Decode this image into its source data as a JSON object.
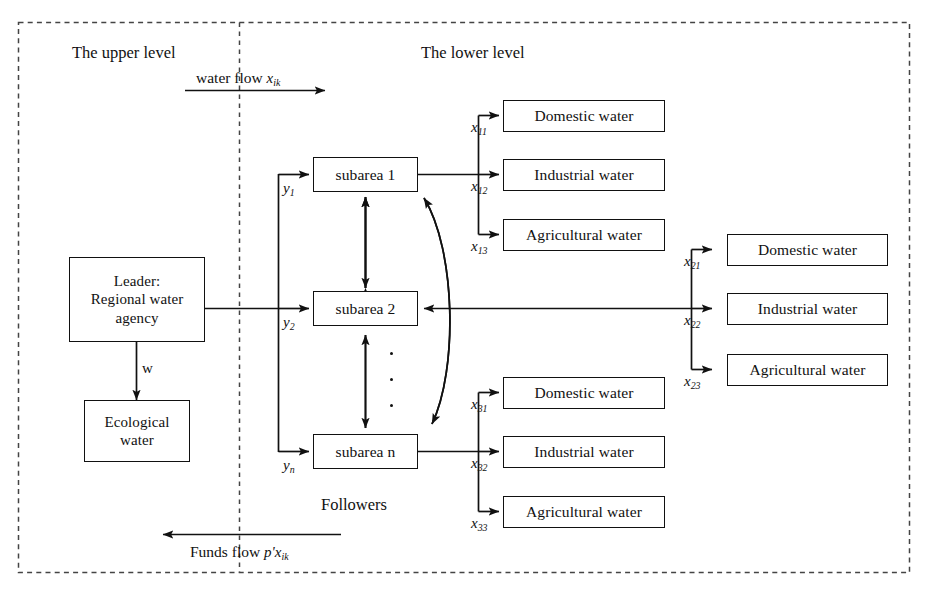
{
  "figure": {
    "outer_border_style": "dashed",
    "divider_style": "dotted",
    "line_color": "#111111",
    "background": "#ffffff"
  },
  "levels": {
    "upper_label": "The upper level",
    "lower_label": "The lower level",
    "followers_label": "Followers"
  },
  "flows": {
    "water_flow_label": "water flow",
    "water_flow_var": "x",
    "water_flow_sub": "ik",
    "water_flow_direction": "right",
    "funds_flow_label": "Funds flow",
    "funds_flow_var": "p'x",
    "funds_flow_sub": "ik",
    "funds_flow_direction": "left"
  },
  "leader": {
    "line1": "Leader:",
    "line2": "Regional water",
    "line3": "agency",
    "eco_line1": "Ecological",
    "eco_line2": "water",
    "eco_edge_label": "w"
  },
  "subareas": [
    {
      "id": "subarea-1",
      "label": "subarea 1",
      "inflow_var": "y",
      "inflow_sub": "1"
    },
    {
      "id": "subarea-2",
      "label": "subarea 2",
      "inflow_var": "y",
      "inflow_sub": "2"
    },
    {
      "id": "subarea-n",
      "label": "subarea n",
      "inflow_var": "y",
      "inflow_sub": "n"
    }
  ],
  "demand_clusters": [
    {
      "id": "cluster-1",
      "source": "subarea 1",
      "side": "right",
      "items": [
        {
          "label": "Domestic water",
          "var": "x",
          "sub": "11"
        },
        {
          "label": "Industrial water",
          "var": "x",
          "sub": "12"
        },
        {
          "label": "Agricultural water",
          "var": "x",
          "sub": "13"
        }
      ]
    },
    {
      "id": "cluster-2",
      "source": "subarea 2",
      "side": "far-right",
      "items": [
        {
          "label": "Domestic water",
          "var": "x",
          "sub": "21"
        },
        {
          "label": "Industrial water",
          "var": "x",
          "sub": "22"
        },
        {
          "label": "Agricultural water",
          "var": "x",
          "sub": "23"
        }
      ]
    },
    {
      "id": "cluster-n",
      "source": "subarea n",
      "side": "right",
      "items": [
        {
          "label": "Domestic water",
          "var": "x",
          "sub": "31"
        },
        {
          "label": "Industrial water",
          "var": "x",
          "sub": "32"
        },
        {
          "label": "Agricultural water",
          "var": "x",
          "sub": "33"
        }
      ]
    }
  ],
  "ellipsis": {
    "symbol": "vertical-dots",
    "count": 3
  }
}
